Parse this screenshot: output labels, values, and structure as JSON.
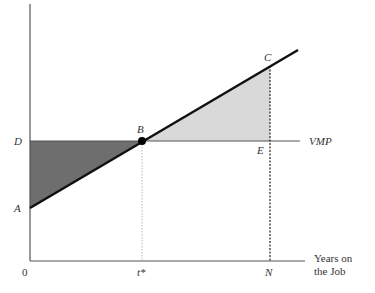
{
  "diagram": {
    "points": {
      "A": "A",
      "B": "B",
      "C": "C",
      "D": "D",
      "E": "E"
    },
    "curve_label": "VMP",
    "x_axis": {
      "origin": "0",
      "tick_tstar": "t*",
      "tick_N": "N",
      "label_line1": "Years on",
      "label_line2": "the Job"
    },
    "colors": {
      "dark_shade": "#6e6e6e",
      "light_shade": "#d9d9d9",
      "axis": "#555555",
      "wage_line": "#111111"
    }
  }
}
